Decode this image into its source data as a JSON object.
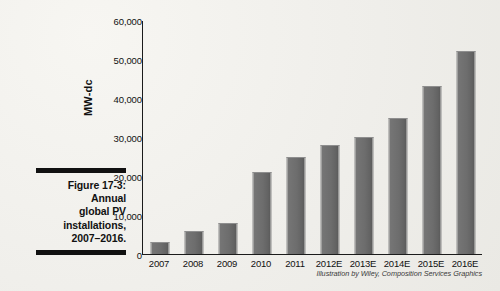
{
  "caption": {
    "lines": [
      "Figure 17-3:",
      "Annual",
      "global PV",
      "installations,",
      "2007–2016."
    ]
  },
  "credit": "Illustration by Wiley, Composition Services Graphics",
  "colors": {
    "bar_fill": "#6d6d6d",
    "bar_edge": "#8e8e8e",
    "axis": "#1b1b1b",
    "page_background": "#f0efeb",
    "text": "#111111"
  },
  "chart_data": {
    "type": "bar",
    "title": "",
    "xlabel": "",
    "ylabel": "MW-dc",
    "categories": [
      "2007",
      "2008",
      "2009",
      "2010",
      "2011",
      "2012E",
      "2013E",
      "2014E",
      "2015E",
      "2016E"
    ],
    "values": [
      3000,
      6000,
      8000,
      21000,
      25000,
      28000,
      30000,
      35000,
      43000,
      52000
    ],
    "ylim": [
      0,
      60000
    ],
    "yticks": [
      0,
      10000,
      20000,
      30000,
      40000,
      50000,
      60000
    ],
    "ytick_labels": [
      "0",
      "10,000",
      "20,000",
      "30,000",
      "40,000",
      "50,000",
      "60,000"
    ],
    "grid": false,
    "legend": false
  }
}
